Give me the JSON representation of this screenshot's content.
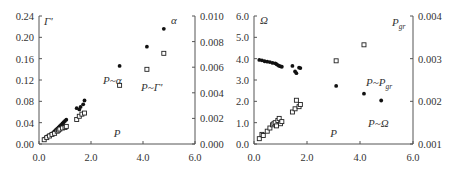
{
  "chart_data": [
    {
      "type": "scatter",
      "panel": "left",
      "xlabel": "P",
      "ylabel_left": "Γ'",
      "ylabel_right": "α",
      "xlim": [
        0,
        6
      ],
      "ylim_left": [
        0,
        0.24
      ],
      "ylim_right": [
        0,
        0.01
      ],
      "x_ticks": [
        "0.0",
        "2.0",
        "4.0",
        "6.0"
      ],
      "y_ticks_left": [
        "0.00",
        "0.04",
        "0.08",
        "0.12",
        "0.16",
        "0.20",
        "0.24"
      ],
      "y_ticks_right": [
        "0.000",
        "0.002",
        "0.004",
        "0.006",
        "0.008",
        "0.010"
      ],
      "grid": false,
      "annotations": [
        "P~α",
        "P~Γ'"
      ],
      "series": [
        {
          "name": "P~α",
          "axis": "right",
          "marker": "filled-circle",
          "points": [
            [
              0.2,
              0.0004
            ],
            [
              0.25,
              0.0005
            ],
            [
              0.3,
              0.0006
            ],
            [
              0.35,
              0.0006
            ],
            [
              0.4,
              0.0007
            ],
            [
              0.45,
              0.0007
            ],
            [
              0.5,
              0.0008
            ],
            [
              0.55,
              0.0009
            ],
            [
              0.6,
              0.001
            ],
            [
              0.65,
              0.0011
            ],
            [
              0.7,
              0.0012
            ],
            [
              0.75,
              0.0013
            ],
            [
              0.8,
              0.0014
            ],
            [
              0.85,
              0.0015
            ],
            [
              0.9,
              0.0016
            ],
            [
              0.95,
              0.0017
            ],
            [
              1.0,
              0.0018
            ],
            [
              1.05,
              0.0019
            ],
            [
              1.45,
              0.0028
            ],
            [
              1.55,
              0.0027
            ],
            [
              1.6,
              0.0029
            ],
            [
              1.7,
              0.0031
            ],
            [
              1.75,
              0.0034
            ],
            [
              3.1,
              0.0061
            ],
            [
              4.15,
              0.0076
            ],
            [
              4.8,
              0.009
            ]
          ]
        },
        {
          "name": "P~Γ'",
          "axis": "left",
          "marker": "open-square",
          "points": [
            [
              0.2,
              0.008
            ],
            [
              0.3,
              0.012
            ],
            [
              0.4,
              0.015
            ],
            [
              0.5,
              0.018
            ],
            [
              0.6,
              0.02
            ],
            [
              0.7,
              0.024
            ],
            [
              0.75,
              0.026
            ],
            [
              0.8,
              0.028
            ],
            [
              0.9,
              0.03
            ],
            [
              1.0,
              0.031
            ],
            [
              1.05,
              0.033
            ],
            [
              1.45,
              0.046
            ],
            [
              1.55,
              0.052
            ],
            [
              1.65,
              0.056
            ],
            [
              1.75,
              0.058
            ],
            [
              3.1,
              0.11
            ],
            [
              4.15,
              0.14
            ],
            [
              4.8,
              0.17
            ]
          ]
        }
      ]
    },
    {
      "type": "scatter",
      "panel": "right",
      "xlabel": "P",
      "ylabel_left": "Ω",
      "ylabel_right": "P_gr",
      "xlim": [
        0,
        6
      ],
      "ylim_left": [
        0,
        6
      ],
      "ylim_right": [
        0.001,
        0.004
      ],
      "x_ticks": [
        "0.0",
        "2.0",
        "4.0",
        "6.0"
      ],
      "y_ticks_left": [
        "0.0",
        "1.0",
        "2.0",
        "3.0",
        "4.0",
        "5.0",
        "6.0"
      ],
      "y_ticks_right": [
        "0.001",
        "0.002",
        "0.003",
        "0.004"
      ],
      "grid": false,
      "annotations": [
        "P~P_gr",
        "P~Ω"
      ],
      "series": [
        {
          "name": "P~P_gr",
          "axis": "right",
          "marker": "filled-circle",
          "points": [
            [
              0.2,
              0.00297
            ],
            [
              0.3,
              0.00296
            ],
            [
              0.4,
              0.00294
            ],
            [
              0.5,
              0.00293
            ],
            [
              0.6,
              0.00292
            ],
            [
              0.7,
              0.0029
            ],
            [
              0.8,
              0.00289
            ],
            [
              0.85,
              0.00287
            ],
            [
              0.9,
              0.00285
            ],
            [
              0.95,
              0.00283
            ],
            [
              1.0,
              0.00282
            ],
            [
              1.05,
              0.00281
            ],
            [
              1.45,
              0.00283
            ],
            [
              1.55,
              0.0027
            ],
            [
              1.6,
              0.00266
            ],
            [
              1.7,
              0.00279
            ],
            [
              1.75,
              0.00278
            ],
            [
              3.1,
              0.00236
            ],
            [
              4.15,
              0.00218
            ],
            [
              4.8,
              0.00202
            ]
          ]
        },
        {
          "name": "P~Ω",
          "axis": "left",
          "marker": "open-square",
          "points": [
            [
              0.2,
              0.25
            ],
            [
              0.3,
              0.45
            ],
            [
              0.35,
              0.4
            ],
            [
              0.5,
              0.6
            ],
            [
              0.6,
              0.75
            ],
            [
              0.7,
              0.9
            ],
            [
              0.75,
              0.95
            ],
            [
              0.8,
              1.0
            ],
            [
              0.85,
              0.85
            ],
            [
              0.9,
              1.1
            ],
            [
              0.95,
              1.2
            ],
            [
              1.0,
              0.95
            ],
            [
              1.05,
              1.05
            ],
            [
              1.45,
              1.5
            ],
            [
              1.55,
              1.65
            ],
            [
              1.6,
              2.05
            ],
            [
              1.7,
              1.75
            ],
            [
              1.75,
              1.85
            ],
            [
              3.1,
              3.9
            ],
            [
              4.15,
              4.65
            ]
          ]
        }
      ]
    }
  ]
}
